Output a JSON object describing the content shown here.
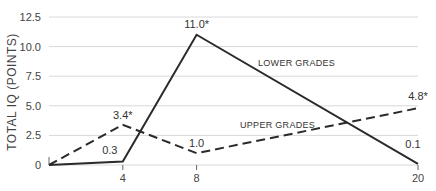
{
  "chart_data": {
    "type": "line",
    "title": "",
    "xlabel": "",
    "ylabel": "TOTAL IQ (POINTS)",
    "x": [
      0,
      4,
      8,
      20
    ],
    "x_ticks": [
      "4",
      "8",
      "20"
    ],
    "y_ticks": [
      "0",
      "2.5",
      "5.0",
      "7.5",
      "10.0",
      "12.5"
    ],
    "y_tick_values": [
      0,
      2.5,
      5.0,
      7.5,
      10.0,
      12.5
    ],
    "ylim": [
      0,
      12.5
    ],
    "xlim": [
      0,
      20
    ],
    "grid": true,
    "series": [
      {
        "name": "LOWER GRADES",
        "style": "solid",
        "values": [
          0,
          0.3,
          11.0,
          0.1
        ],
        "labels": [
          "",
          "0.3",
          "11.0*",
          "0.1"
        ]
      },
      {
        "name": "UPPER GRADES",
        "style": "dashed",
        "values": [
          0,
          3.4,
          1.0,
          4.8
        ],
        "labels": [
          "",
          "3.4*",
          "1.0",
          "4.8*"
        ]
      }
    ]
  },
  "colors": {
    "line": "#2a2a2a",
    "grid": "#d8d8d8",
    "text": "#444444"
  }
}
